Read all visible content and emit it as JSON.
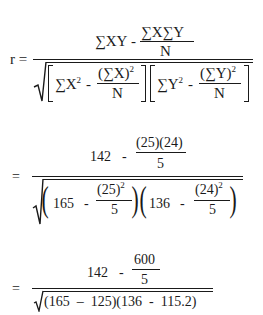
{
  "formula": {
    "definition": {
      "lhs": "r =",
      "numerator": {
        "term1": "∑XY",
        "minus": "-",
        "frac_num": "∑X∑Y",
        "frac_den": "N"
      },
      "denominator": {
        "left": {
          "term": "∑X",
          "exp": "2",
          "minus": "-",
          "frac_num": "(∑X)",
          "frac_exp": "2",
          "frac_den": "N"
        },
        "right": {
          "term": "∑Y",
          "exp": "2",
          "minus": "-",
          "frac_num": "(∑Y)",
          "frac_exp": "2",
          "frac_den": "N"
        }
      }
    },
    "substitution": {
      "eq": "=",
      "numerator": {
        "term1": "142",
        "minus": "-",
        "frac_num": "(25)(24)",
        "frac_den": "5"
      },
      "denominator": {
        "left": {
          "term": "165",
          "minus": "-",
          "frac_num": "(25)",
          "frac_exp": "2",
          "frac_den": "5"
        },
        "right": {
          "term": "136",
          "minus": "-",
          "frac_num": "(24)",
          "frac_exp": "2",
          "frac_den": "5"
        }
      }
    },
    "simplified": {
      "eq": "=",
      "numerator": {
        "term1": "142",
        "minus": "-",
        "frac_num": "600",
        "frac_den": "5"
      },
      "denominator": "(165  –  125)(136  -  115.2)"
    }
  }
}
